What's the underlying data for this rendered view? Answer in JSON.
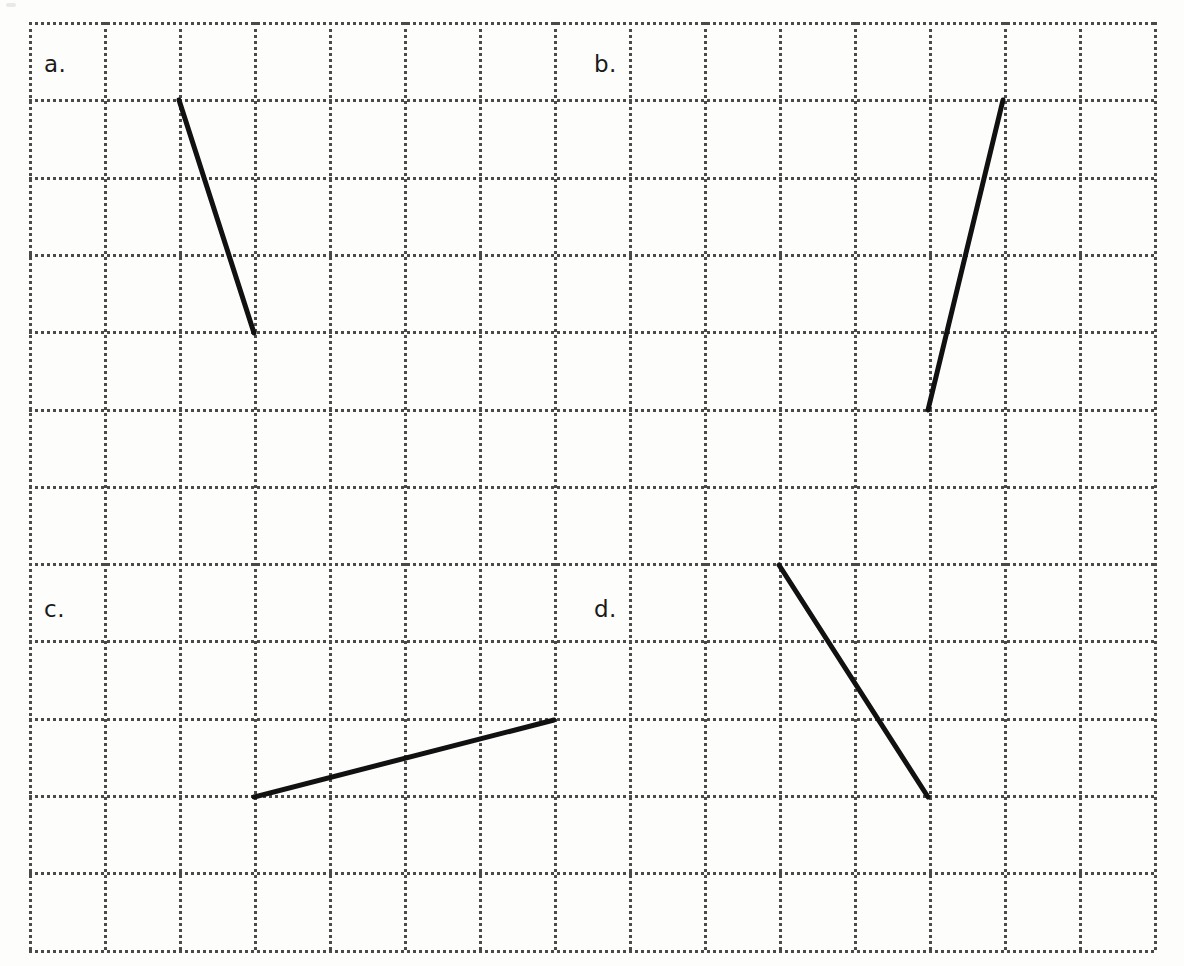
{
  "page": {
    "width": 1184,
    "height": 966,
    "background_color": "#fdfdfc"
  },
  "grid": {
    "origin_x": 29,
    "origin_y": 22,
    "cell_width": 75,
    "cell_height": 77.3,
    "columns": 15,
    "rows": 12,
    "line_color": "#4a4a4a",
    "line_style": "dotted",
    "line_width": 3
  },
  "labels": [
    {
      "id": "a",
      "text": "a.",
      "x": 44,
      "y": 53
    },
    {
      "id": "b",
      "text": "b.",
      "x": 594,
      "y": 53
    },
    {
      "id": "c",
      "text": "c.",
      "x": 44,
      "y": 598
    },
    {
      "id": "d",
      "text": "d.",
      "x": 594,
      "y": 598
    }
  ],
  "chart_data": {
    "type": "line",
    "title": "",
    "xlabel": "",
    "ylabel": "",
    "grid": true,
    "legend": "none",
    "xlim": [
      0,
      15
    ],
    "ylim": [
      0,
      12
    ],
    "segment_color": "#111111",
    "segment_width": 5,
    "series": [
      {
        "name": "a",
        "label": "a.",
        "pixel_start": {
          "x": 179,
          "y": 100
        },
        "pixel_end": {
          "x": 254,
          "y": 333
        },
        "grid_start": {
          "col": 2,
          "row": 1
        },
        "grid_end": {
          "col": 3,
          "row": 4
        },
        "rise": -3,
        "run": 1,
        "slope": -3
      },
      {
        "name": "b",
        "label": "b.",
        "pixel_start": {
          "x": 928,
          "y": 410
        },
        "pixel_end": {
          "x": 1003,
          "y": 100
        },
        "grid_start": {
          "col": 12,
          "row": 5
        },
        "grid_end": {
          "col": 13,
          "row": 1
        },
        "rise": 4,
        "run": 1,
        "slope": 4
      },
      {
        "name": "c",
        "label": "c.",
        "pixel_start": {
          "x": 254,
          "y": 797
        },
        "pixel_end": {
          "x": 554,
          "y": 720
        },
        "grid_start": {
          "col": 3,
          "row": 10
        },
        "grid_end": {
          "col": 7,
          "row": 9
        },
        "rise": 1,
        "run": 4,
        "slope": 0.25
      },
      {
        "name": "d",
        "label": "d.",
        "pixel_start": {
          "x": 779,
          "y": 565
        },
        "pixel_end": {
          "x": 928,
          "y": 797
        },
        "grid_start": {
          "col": 10,
          "row": 7
        },
        "grid_end": {
          "col": 12,
          "row": 10
        },
        "rise": -3,
        "run": 2,
        "slope": -1.5
      }
    ]
  }
}
